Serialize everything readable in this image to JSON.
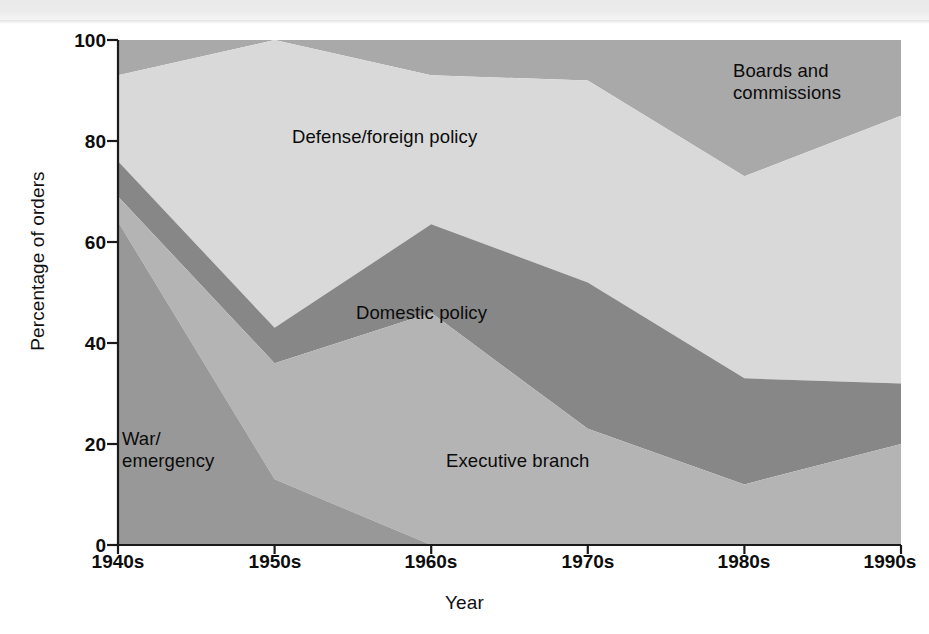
{
  "figure": {
    "background_color": "#ffffff",
    "plot_area": {
      "left": 118,
      "right": 901,
      "top": 40,
      "bottom": 545
    }
  },
  "chart_data": {
    "type": "area",
    "stacked": true,
    "title": "",
    "subtitle": "",
    "xlabel": "Year",
    "ylabel": "Percentage of orders",
    "categories": [
      "1940s",
      "1950s",
      "1960s",
      "1970s",
      "1980s",
      "1990s"
    ],
    "x_tick_labels": [
      "1940s",
      "1950s",
      "1960s",
      "1970s",
      "1980s",
      "1990s"
    ],
    "y_tick_labels": [
      "0",
      "20",
      "40",
      "60",
      "80",
      "100"
    ],
    "y_ticks": [
      0,
      20,
      40,
      60,
      80,
      100
    ],
    "ylim": [
      0,
      100
    ],
    "grid": false,
    "legend": "inline-labels",
    "stack_order_bottom_to_top": [
      "War/emergency",
      "Executive branch",
      "Domestic policy",
      "Defense/foreign policy",
      "Boards and commissions"
    ],
    "series": [
      {
        "name": "War/\nemergency",
        "label": "War/\nemergency",
        "color": "#989898",
        "values": [
          64,
          13,
          0,
          0,
          0,
          0
        ],
        "cumulative_top": [
          64,
          13,
          0,
          0,
          0,
          0
        ]
      },
      {
        "name": "Executive branch",
        "label": "Executive branch",
        "color": "#b4b4b4",
        "values": [
          5,
          23,
          46,
          23,
          12,
          20
        ],
        "cumulative_top": [
          69,
          36,
          46,
          23,
          12,
          20
        ]
      },
      {
        "name": "Domestic policy",
        "label": "Domestic policy",
        "color": "#878787",
        "values": [
          7,
          7,
          17.5,
          29,
          21,
          12
        ],
        "cumulative_top": [
          76,
          43,
          63.5,
          52,
          33,
          32
        ]
      },
      {
        "name": "Defense/foreign policy",
        "label": "Defense/foreign policy",
        "color": "#d9d9d9",
        "values": [
          17,
          57,
          29.5,
          40,
          40,
          53
        ],
        "cumulative_top": [
          93,
          100,
          93,
          92,
          73,
          85
        ]
      },
      {
        "name": "Boards and\ncommissions",
        "label": "Boards and\ncommissions",
        "color": "#a9a9a9",
        "values": [
          7,
          0,
          7,
          8,
          27,
          15
        ],
        "cumulative_top": [
          100,
          100,
          100,
          100,
          100,
          100
        ]
      }
    ],
    "annotations": [
      {
        "text": "Boards and\ncommissions",
        "x_px": 733,
        "y_px": 60
      },
      {
        "text": "Defense/foreign policy",
        "x_px": 292,
        "y_px": 126
      },
      {
        "text": "Domestic policy",
        "x_px": 356,
        "y_px": 302
      },
      {
        "text": "Executive branch",
        "x_px": 446,
        "y_px": 450
      },
      {
        "text": "War/\nemergency",
        "x_px": 122,
        "y_px": 428
      }
    ]
  },
  "axis": {
    "y_title": "Percentage of orders",
    "x_title": "Year",
    "y_ticks": [
      {
        "label": "100",
        "value": 100
      },
      {
        "label": "80",
        "value": 80
      },
      {
        "label": "60",
        "value": 60
      },
      {
        "label": "40",
        "value": 40
      },
      {
        "label": "20",
        "value": 20
      },
      {
        "label": "0",
        "value": 0
      }
    ],
    "x_ticks": [
      {
        "label": "1940s"
      },
      {
        "label": "1950s"
      },
      {
        "label": "1960s"
      },
      {
        "label": "1970s"
      },
      {
        "label": "1980s"
      },
      {
        "label": "1990s"
      }
    ]
  },
  "colors": {
    "boards": "#a9a9a9",
    "defense": "#d9d9d9",
    "domestic": "#878787",
    "executive": "#b4b4b4",
    "war": "#989898",
    "axis": "#1a1a1a",
    "text": "#0d0d0d"
  }
}
